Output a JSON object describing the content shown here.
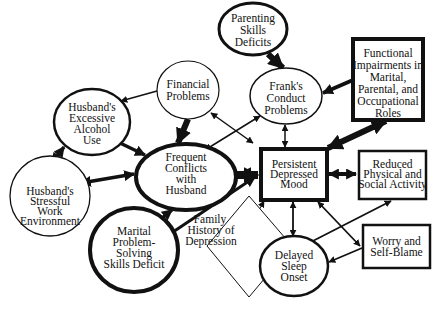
{
  "diagram": {
    "type": "case-formulation",
    "nodes": [
      {
        "id": "parenting",
        "shape": "ellipse",
        "lines": [
          "Parenting",
          "Skills",
          "Deficits"
        ],
        "border": "thick"
      },
      {
        "id": "franks",
        "shape": "ellipse",
        "lines": [
          "Frank's",
          "Conduct",
          "Problems"
        ],
        "border": "thin"
      },
      {
        "id": "functional",
        "shape": "box",
        "lines": [
          "Functional",
          "Impairments in",
          "Marital,",
          "Parental, and",
          "Occupational",
          "Roles"
        ],
        "border": "thick"
      },
      {
        "id": "financial",
        "shape": "ellipse",
        "lines": [
          "Financial",
          "Problems"
        ],
        "border": "thin"
      },
      {
        "id": "alcohol",
        "shape": "ellipse",
        "lines": [
          "Husband's",
          "Excessive",
          "Alcohol",
          "Use"
        ],
        "border": "medium"
      },
      {
        "id": "conflicts",
        "shape": "ellipse",
        "lines": [
          "Frequent",
          "Conflicts",
          "with",
          "Husband"
        ],
        "border": "thick"
      },
      {
        "id": "mood",
        "shape": "box",
        "lines": [
          "Persistent",
          "Depressed",
          "Mood"
        ],
        "border": "thick"
      },
      {
        "id": "reduced",
        "shape": "box",
        "lines": [
          "Reduced",
          "Physical and",
          "Social Activity"
        ],
        "border": "medium"
      },
      {
        "id": "stressful",
        "shape": "ellipse",
        "lines": [
          "Husband's",
          "Stressful",
          "Work",
          "Environment"
        ],
        "border": "thin"
      },
      {
        "id": "marital",
        "shape": "ellipse",
        "lines": [
          "Marital",
          "Problem-",
          "Solving",
          "Skills Deficit"
        ],
        "border": "thick"
      },
      {
        "id": "family",
        "shape": "diamond",
        "lines": [
          "Family",
          "History of",
          "Depression"
        ],
        "border": "thin"
      },
      {
        "id": "sleep",
        "shape": "ellipse",
        "lines": [
          "Delayed",
          "Sleep",
          "Onset"
        ],
        "border": "medium"
      },
      {
        "id": "worry",
        "shape": "box",
        "lines": [
          "Worry and",
          "Self-Blame"
        ],
        "border": "medium"
      }
    ],
    "edges": [
      {
        "from": "parenting",
        "to": "franks",
        "weight": "thick",
        "direction": "forward"
      },
      {
        "from": "functional",
        "to": "franks",
        "weight": "medium",
        "direction": "forward"
      },
      {
        "from": "mood",
        "to": "functional",
        "weight": "thick",
        "direction": "both"
      },
      {
        "from": "financial",
        "to": "alcohol",
        "weight": "thin",
        "direction": "forward"
      },
      {
        "from": "financial",
        "to": "conflicts",
        "weight": "thick",
        "direction": "forward"
      },
      {
        "from": "financial",
        "to": "mood",
        "weight": "thin",
        "direction": "both"
      },
      {
        "from": "conflicts",
        "to": "franks",
        "weight": "thin",
        "direction": "both"
      },
      {
        "from": "franks",
        "to": "mood",
        "weight": "thin",
        "direction": "both"
      },
      {
        "from": "alcohol",
        "to": "conflicts",
        "weight": "medium",
        "direction": "forward"
      },
      {
        "from": "alcohol",
        "to": "stressful",
        "weight": "medium",
        "direction": "both"
      },
      {
        "from": "stressful",
        "to": "conflicts",
        "weight": "medium",
        "direction": "both"
      },
      {
        "from": "conflicts",
        "to": "mood",
        "weight": "thick",
        "direction": "both"
      },
      {
        "from": "marital",
        "to": "conflicts",
        "weight": "medium",
        "direction": "forward"
      },
      {
        "from": "marital",
        "to": "mood",
        "weight": "medium",
        "direction": "forward"
      },
      {
        "from": "family",
        "to": "mood",
        "weight": "thin",
        "direction": "forward"
      },
      {
        "from": "mood",
        "to": "reduced",
        "weight": "medium",
        "direction": "both"
      },
      {
        "from": "mood",
        "to": "sleep",
        "weight": "thin",
        "direction": "both"
      },
      {
        "from": "mood",
        "to": "worry",
        "weight": "thin",
        "direction": "both"
      },
      {
        "from": "reduced",
        "to": "sleep",
        "weight": "thin",
        "direction": "both"
      },
      {
        "from": "worry",
        "to": "sleep",
        "weight": "thin",
        "direction": "forward"
      }
    ]
  }
}
